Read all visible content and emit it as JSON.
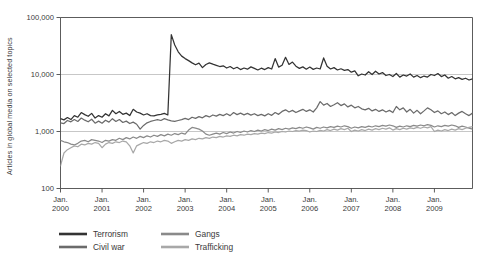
{
  "chart_data": {
    "type": "line",
    "title": "",
    "subtitle": "",
    "xlabel": "",
    "ylabel": "Articles in global media on selected topics",
    "yscale": "log",
    "ylim": [
      100,
      100000
    ],
    "ytick_labels": [
      "100",
      "1,000",
      "10,000",
      "100,000"
    ],
    "ytick_values": [
      100,
      1000,
      10000,
      100000
    ],
    "gridlines": [
      1000,
      10000
    ],
    "grid": true,
    "legend_position": "below-left",
    "x_start": "Jan. 2000",
    "x_end": "Dec. 2009",
    "x_interval": "monthly",
    "xtick_labels": [
      "Jan.\n2000",
      "Jan.\n2001",
      "Jan.\n2002",
      "Jan.\n2003",
      "Jan.\n2004",
      "Jan.\n2005",
      "Jan.\n2006",
      "Jan.\n2007",
      "Jan.\n2008",
      "Jan.\n2009"
    ],
    "xticks": [
      {
        "line1": "Jan.",
        "line2": "2000"
      },
      {
        "line1": "Jan.",
        "line2": "2001"
      },
      {
        "line1": "Jan.",
        "line2": "2002"
      },
      {
        "line1": "Jan.",
        "line2": "2003"
      },
      {
        "line1": "Jan.",
        "line2": "2004"
      },
      {
        "line1": "Jan.",
        "line2": "2005"
      },
      {
        "line1": "Jan.",
        "line2": "2006"
      },
      {
        "line1": "Jan.",
        "line2": "2007"
      },
      {
        "line1": "Jan.",
        "line2": "2008"
      },
      {
        "line1": "Jan.",
        "line2": "2009"
      }
    ],
    "series": [
      {
        "name": "Terrorism",
        "color": "#333333",
        "values": [
          1680,
          1600,
          1760,
          1620,
          1900,
          1780,
          2150,
          1980,
          1850,
          2080,
          1720,
          1900,
          1780,
          2050,
          1880,
          2350,
          2050,
          2250,
          2000,
          2100,
          1900,
          2450,
          2200,
          2100,
          1950,
          2050,
          1900,
          1880,
          1960,
          2000,
          2080,
          1950,
          50000,
          33000,
          25000,
          21000,
          19000,
          17500,
          16000,
          14800,
          15800,
          13200,
          15000,
          16000,
          15200,
          14500,
          13800,
          14200,
          13000,
          13800,
          12600,
          13400,
          12200,
          13000,
          12400,
          13600,
          12800,
          12000,
          12900,
          12200,
          13200,
          12500,
          19000,
          13500,
          14500,
          20000,
          15000,
          16500,
          14000,
          12800,
          13600,
          12400,
          13500,
          12300,
          13000,
          12500,
          19500,
          14000,
          12500,
          13200,
          12000,
          12600,
          11800,
          12200,
          11000,
          11600,
          9500,
          10200,
          9800,
          11200,
          10000,
          11400,
          10200,
          10800,
          9600,
          10000,
          9200,
          10400,
          9000,
          9800,
          9400,
          10200,
          9000,
          9600,
          8800,
          9400,
          9000,
          10000,
          9600,
          10400,
          9200,
          9800,
          8600,
          9200,
          8400,
          8800,
          8200,
          8600,
          8000,
          8400
        ]
      },
      {
        "name": "Civil war",
        "color": "#6b6b6b",
        "values": [
          1420,
          1380,
          1560,
          1480,
          1620,
          1500,
          1720,
          1580,
          1480,
          1640,
          1400,
          1520,
          1400,
          1580,
          1460,
          1680,
          1500,
          1620,
          1440,
          1520,
          1380,
          1460,
          1340,
          1100,
          1280,
          1420,
          1500,
          1560,
          1620,
          1560,
          1680,
          1600,
          1540,
          1500,
          1560,
          1620,
          1700,
          1620,
          1780,
          1700,
          1820,
          1740,
          1900,
          1800,
          1950,
          1860,
          2000,
          1900,
          2050,
          1900,
          2150,
          1980,
          2100,
          1960,
          2080,
          1940,
          2050,
          1900,
          2000,
          1880,
          2050,
          1920,
          2150,
          2000,
          2250,
          2400,
          2200,
          2350,
          2150,
          2300,
          2450,
          2250,
          2400,
          2200,
          2600,
          3350,
          2900,
          3100,
          2750,
          2950,
          3200,
          2850,
          3050,
          2700,
          2900,
          2600,
          2750,
          2500,
          2400,
          2550,
          2300,
          2450,
          2250,
          2400,
          2200,
          2350,
          2150,
          2750,
          2400,
          2600,
          2200,
          2450,
          2100,
          2350,
          2050,
          2300,
          2600,
          2400,
          2150,
          2300,
          2050,
          2200,
          1980,
          2150,
          1900,
          2100,
          2250,
          2050,
          1900,
          2100
        ]
      },
      {
        "name": "Gangs",
        "color": "#8a8a8a",
        "values": [
          700,
          660,
          640,
          600,
          580,
          620,
          680,
          700,
          660,
          720,
          700,
          680,
          640,
          700,
          680,
          720,
          700,
          760,
          720,
          780,
          740,
          800,
          760,
          820,
          780,
          840,
          800,
          860,
          820,
          880,
          840,
          900,
          860,
          920,
          880,
          940,
          900,
          1060,
          1180,
          1150,
          1100,
          1020,
          900,
          860,
          900,
          940,
          900,
          960,
          920,
          980,
          940,
          1000,
          960,
          1020,
          980,
          1040,
          1000,
          1060,
          1020,
          1080,
          1040,
          1100,
          1060,
          1120,
          1080,
          1140,
          1100,
          1160,
          1120,
          1180,
          1140,
          1200,
          1160,
          1100,
          1180,
          1140,
          1200,
          1160,
          1220,
          1180,
          1240,
          1200,
          1260,
          1220,
          1140,
          1200,
          1160,
          1220,
          1180,
          1240,
          1200,
          1260,
          1220,
          1280,
          1240,
          1300,
          1260,
          1180,
          1240,
          1200,
          1260,
          1220,
          1280,
          1240,
          1300,
          1260,
          1320,
          1280,
          1200,
          1260,
          1220,
          1280,
          1240,
          1300,
          1260,
          1180,
          1240,
          1200,
          1150,
          1100
        ]
      },
      {
        "name": "Trafficking",
        "color": "#a8a8a8",
        "values": [
          250,
          420,
          480,
          520,
          560,
          540,
          600,
          580,
          620,
          600,
          640,
          620,
          520,
          600,
          640,
          620,
          660,
          640,
          680,
          660,
          560,
          420,
          560,
          600,
          640,
          620,
          660,
          640,
          680,
          660,
          700,
          680,
          620,
          660,
          700,
          680,
          720,
          700,
          740,
          720,
          760,
          740,
          780,
          760,
          800,
          780,
          820,
          800,
          840,
          820,
          860,
          840,
          880,
          860,
          900,
          880,
          920,
          900,
          940,
          920,
          960,
          940,
          980,
          960,
          1000,
          980,
          1020,
          1000,
          1040,
          1020,
          1060,
          1040,
          980,
          1020,
          1000,
          1050,
          1020,
          1080,
          1040,
          1100,
          1060,
          1120,
          1080,
          1140,
          1000,
          1060,
          1020,
          1080,
          1040,
          1100,
          1060,
          1120,
          1080,
          1140,
          1100,
          1160,
          1060,
          1120,
          1080,
          1140,
          1100,
          1160,
          1120,
          1180,
          1140,
          1200,
          1160,
          1220,
          1000,
          1060,
          1020,
          1080,
          1040,
          1100,
          1060,
          1120,
          1080,
          1140,
          1180,
          1220
        ]
      }
    ],
    "legend": [
      {
        "label": "Terrorism",
        "color": "#333333"
      },
      {
        "label": "Civil war",
        "color": "#6b6b6b"
      },
      {
        "label": "Gangs",
        "color": "#8a8a8a"
      },
      {
        "label": "Trafficking",
        "color": "#a8a8a8"
      }
    ]
  }
}
